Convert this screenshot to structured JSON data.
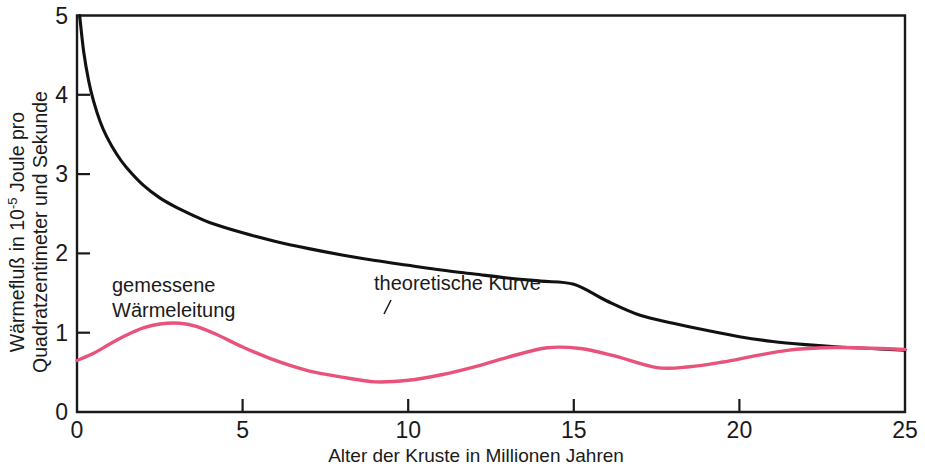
{
  "chart_data": {
    "type": "line",
    "title": "",
    "xlabel": "Alter der Kruste in Millionen Jahren",
    "ylabel_line1": "Wärmefluß in 10",
    "ylabel_exponent": "-5",
    "ylabel_line1_tail": " Joule pro",
    "ylabel_line2": "Quadratzentimeter und Sekunde",
    "xlim": [
      0,
      25
    ],
    "ylim": [
      0,
      5
    ],
    "xticks": [
      "0",
      "5",
      "10",
      "15",
      "20",
      "25"
    ],
    "xtick_values": [
      0,
      5,
      10,
      15,
      20,
      25
    ],
    "yticks": [
      "0",
      "1",
      "2",
      "3",
      "4",
      "5"
    ],
    "ytick_values": [
      0,
      1,
      2,
      3,
      4,
      5
    ],
    "grid": false,
    "legend_position": "inline-annotations",
    "series": [
      {
        "name": "theoretische Kurve",
        "color": "#111111",
        "annotation": "theoretische Kurve",
        "x": [
          0.08,
          0.2,
          0.35,
          0.5,
          0.7,
          0.9,
          1.2,
          1.5,
          2.0,
          2.5,
          3.0,
          3.5,
          4.0,
          5.0,
          6.0,
          7.0,
          8.0,
          9.0,
          10.0,
          11.0,
          12.0,
          13.0,
          14.0,
          15.0,
          16.0,
          17.0,
          18.0,
          19.0,
          20.0,
          21.0,
          22.0,
          23.0,
          24.0,
          25.0
        ],
        "y": [
          5.0,
          4.55,
          4.18,
          3.92,
          3.66,
          3.47,
          3.25,
          3.08,
          2.86,
          2.7,
          2.58,
          2.48,
          2.39,
          2.26,
          2.15,
          2.06,
          1.98,
          1.91,
          1.85,
          1.79,
          1.74,
          1.69,
          1.65,
          1.61,
          1.4,
          1.22,
          1.12,
          1.03,
          0.95,
          0.89,
          0.85,
          0.82,
          0.8,
          0.78
        ]
      },
      {
        "name": "gemessene Wärmeleitung",
        "color": "#e8537a",
        "annotation_line1": "gemessene",
        "annotation_line2": "Wärmeleitung",
        "x": [
          0.0,
          0.5,
          1.0,
          1.5,
          2.0,
          2.5,
          3.1,
          3.6,
          4.2,
          5.0,
          5.8,
          6.5,
          7.2,
          8.0,
          9.0,
          10.0,
          11.0,
          12.0,
          13.0,
          14.2,
          15.2,
          16.2,
          17.5,
          18.5,
          19.5,
          20.5,
          21.5,
          22.5,
          23.5,
          25.0
        ],
        "y": [
          0.65,
          0.74,
          0.86,
          0.97,
          1.06,
          1.11,
          1.12,
          1.08,
          0.98,
          0.82,
          0.68,
          0.58,
          0.5,
          0.44,
          0.38,
          0.4,
          0.47,
          0.57,
          0.69,
          0.81,
          0.8,
          0.71,
          0.56,
          0.57,
          0.63,
          0.71,
          0.78,
          0.81,
          0.81,
          0.79
        ]
      }
    ],
    "annotations": [
      {
        "name": "gemessene-waermeleitung-label",
        "line1": "gemessene",
        "line2": "Wärmeleitung",
        "x_px": 112,
        "y_px": 292
      },
      {
        "name": "theoretische-kurve-label",
        "text": "theoretische Kurve",
        "x_px": 374,
        "y_px": 290
      }
    ],
    "colors": {
      "theoretical_curve": "#111111",
      "measured_curve": "#e8537a",
      "axis": "#1a1a1a",
      "background": "#ffffff"
    }
  }
}
